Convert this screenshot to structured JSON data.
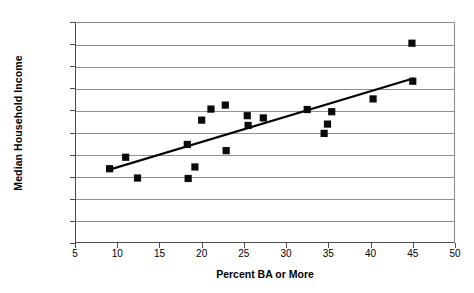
{
  "chart_data": {
    "type": "scatter",
    "title": "",
    "xlabel": "Percent BA or More",
    "ylabel": "Median Household Income",
    "xlim": [
      5,
      50
    ],
    "ylim": [
      10000,
      60000
    ],
    "xticks": [
      5,
      10,
      15,
      20,
      25,
      30,
      35,
      40,
      45,
      50
    ],
    "yticks": [
      10000,
      15000,
      20000,
      25000,
      30000,
      35000,
      40000,
      45000,
      50000,
      55000,
      60000
    ],
    "xtick_labels": [
      "5",
      "10",
      "15",
      "20",
      "25",
      "30",
      "35",
      "40",
      "45",
      "50"
    ],
    "ytick_labels": [
      "$10,000",
      "$15,000",
      "$20,000",
      "$25,000",
      "$30,000",
      "$35,000",
      "$40,000",
      "$45,000",
      "$50,000",
      "$55,000",
      "$60,000"
    ],
    "grid": "horizontal",
    "legend": "none",
    "marker_shape": "square",
    "marker_color": "#0a0a0a",
    "series": [
      {
        "name": "States",
        "points": [
          {
            "x": 9.1,
            "y": 26800
          },
          {
            "x": 11.0,
            "y": 29400
          },
          {
            "x": 12.4,
            "y": 24700
          },
          {
            "x": 18.3,
            "y": 32300
          },
          {
            "x": 18.4,
            "y": 24600
          },
          {
            "x": 19.2,
            "y": 27200
          },
          {
            "x": 20.0,
            "y": 37800
          },
          {
            "x": 21.1,
            "y": 40300
          },
          {
            "x": 22.8,
            "y": 41200
          },
          {
            "x": 22.9,
            "y": 30900
          },
          {
            "x": 25.4,
            "y": 38800
          },
          {
            "x": 25.5,
            "y": 36600
          },
          {
            "x": 27.3,
            "y": 38300
          },
          {
            "x": 32.5,
            "y": 40200
          },
          {
            "x": 34.5,
            "y": 34800
          },
          {
            "x": 34.9,
            "y": 36900
          },
          {
            "x": 35.4,
            "y": 39700
          },
          {
            "x": 40.3,
            "y": 42600
          },
          {
            "x": 44.9,
            "y": 55200
          },
          {
            "x": 45.0,
            "y": 46600
          }
        ]
      }
    ],
    "trendline": {
      "type": "linear",
      "x_start": 9.1,
      "y_start": 26600,
      "x_end": 45.0,
      "y_end": 47200
    }
  }
}
